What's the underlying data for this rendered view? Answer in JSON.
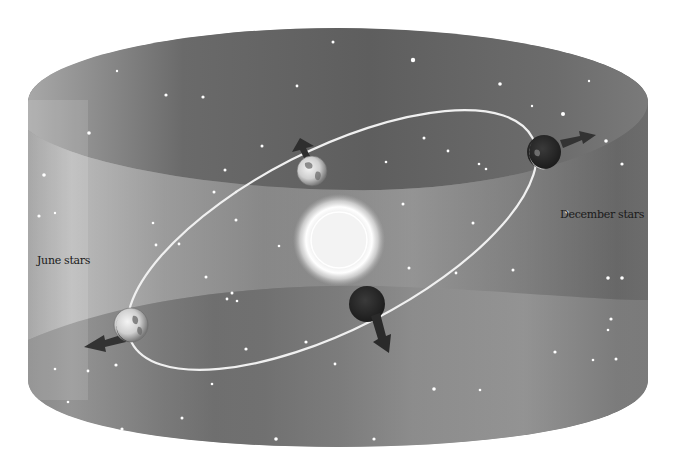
{
  "diagram": {
    "labels": {
      "june": "June stars",
      "december": "December stars"
    },
    "elements": {
      "sun": "Sun",
      "orbit": "Earth orbit",
      "earths": [
        {
          "position": "top",
          "arrow": "up-left",
          "lit": true
        },
        {
          "position": "right",
          "arrow": "right",
          "lit": true
        },
        {
          "position": "bottom",
          "arrow": "down-right",
          "lit": false
        },
        {
          "position": "left",
          "arrow": "down-left",
          "lit": true
        }
      ],
      "cylinder": "Celestial sphere (star field cylinder)"
    },
    "colors": {
      "background": "#ffffff",
      "cylinder_dark": "#4a4a4a",
      "cylinder_mid": "#8a8a8a",
      "cylinder_light": "#c8c8c8",
      "orbit": "#f2f2f2",
      "sun": "#f4f4f4",
      "arrow": "#333333",
      "label_text": "#1a1a1a"
    }
  }
}
